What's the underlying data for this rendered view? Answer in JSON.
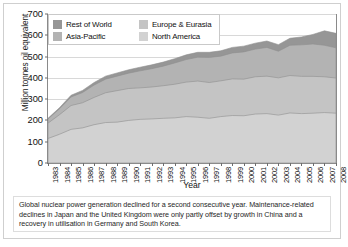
{
  "chart_data": {
    "type": "area",
    "stacked": true,
    "title": "",
    "xlabel": "Year",
    "ylabel": "Million tonnes oil equivalent",
    "ylim": [
      0,
      700
    ],
    "ytick_values": [
      0,
      100,
      200,
      300,
      400,
      500,
      600,
      700
    ],
    "grid": true,
    "legend_position": "top-left-inside",
    "categories": [
      "1983",
      "1984",
      "1985",
      "1986",
      "1987",
      "1988",
      "1989",
      "1990",
      "1991",
      "1992",
      "1993",
      "1994",
      "1995",
      "1996",
      "1997",
      "1998",
      "1999",
      "2000",
      "2001",
      "2002",
      "2003",
      "2004",
      "2005",
      "2006",
      "2007",
      "2008"
    ],
    "series": [
      {
        "name": "North America",
        "color": "#d2d2d2",
        "values": [
          115,
          135,
          158,
          165,
          180,
          190,
          192,
          200,
          205,
          207,
          210,
          212,
          218,
          215,
          210,
          218,
          223,
          222,
          230,
          232,
          225,
          235,
          232,
          234,
          237,
          234
        ]
      },
      {
        "name": "Europe & Eurasia",
        "color": "#c4c4c4",
        "values": [
          72,
          92,
          112,
          118,
          128,
          140,
          148,
          150,
          148,
          150,
          153,
          158,
          162,
          170,
          168,
          168,
          172,
          172,
          175,
          176,
          175,
          176,
          175,
          173,
          168,
          165
        ]
      },
      {
        "name": "Asia-Pacific",
        "color": "#b3b3b3",
        "values": [
          20,
          28,
          40,
          48,
          58,
          64,
          68,
          72,
          80,
          86,
          92,
          100,
          106,
          112,
          118,
          116,
          122,
          128,
          130,
          135,
          125,
          142,
          148,
          152,
          148,
          142
        ]
      },
      {
        "name": "Rest of World",
        "color": "#969696",
        "values": [
          3,
          5,
          8,
          10,
          12,
          14,
          15,
          16,
          17,
          18,
          19,
          20,
          22,
          23,
          24,
          25,
          26,
          27,
          28,
          30,
          31,
          33,
          37,
          45,
          68,
          68
        ]
      }
    ],
    "totals": [
      210,
      260,
      318,
      341,
      378,
      408,
      423,
      438,
      450,
      461,
      474,
      490,
      508,
      520,
      520,
      527,
      543,
      549,
      563,
      573,
      556,
      586,
      592,
      604,
      621,
      609
    ]
  },
  "legend": {
    "items": [
      {
        "label": "Rest of World",
        "color": "#969696"
      },
      {
        "label": "Europe & Eurasia",
        "color": "#c4c4c4"
      },
      {
        "label": "Asia-Pacific",
        "color": "#b3b3b3"
      },
      {
        "label": "North America",
        "color": "#d2d2d2"
      }
    ]
  },
  "caption": {
    "text": "Global nuclear power generation declined for a second consecutive year. Maintenance-related declines in Japan and the United Kingdom were only partly offset by growth in China and a recovery in utilisation in Germany and South Korea."
  }
}
